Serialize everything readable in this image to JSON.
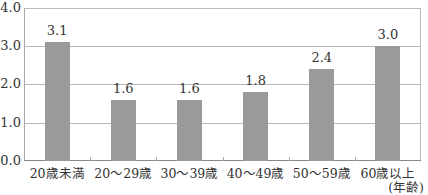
{
  "chart_data": {
    "type": "bar",
    "title": "",
    "xlabel": "(年齢)",
    "ylabel": "",
    "categories": [
      "20歳未満",
      "20～29歳",
      "30～39歳",
      "40～49歳",
      "50～59歳",
      "60歳以上"
    ],
    "values": [
      3.1,
      1.6,
      1.6,
      1.8,
      2.4,
      3.0
    ],
    "value_labels": [
      "3.1",
      "1.6",
      "1.6",
      "1.8",
      "2.4",
      "3.0"
    ],
    "ylim": [
      0,
      4.0
    ],
    "yticks": [
      "0.0",
      "1.0",
      "2.0",
      "3.0",
      "4.0"
    ],
    "grid": true,
    "legend": null,
    "bar_color": "#9a9a9a"
  },
  "axis": {
    "unit_label": "(年齢)",
    "y_ticks": [
      {
        "label": "4.0",
        "value": 4.0
      },
      {
        "label": "3.0",
        "value": 3.0
      },
      {
        "label": "2.0",
        "value": 2.0
      },
      {
        "label": "1.0",
        "value": 1.0
      },
      {
        "label": "0.0",
        "value": 0.0
      }
    ]
  }
}
